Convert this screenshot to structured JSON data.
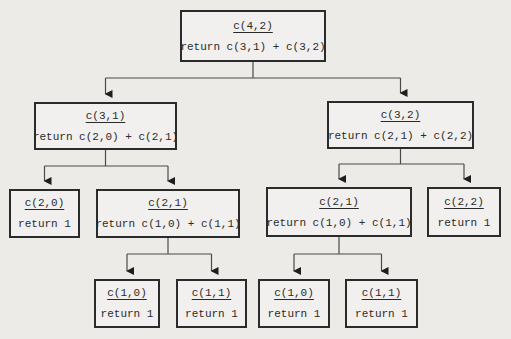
{
  "diagram": {
    "type": "recursion-tree",
    "nodes": [
      {
        "id": "n42",
        "title": "c(4,2)",
        "body": "return c(3,1) + c(3,2)",
        "children": [
          "n31",
          "n32"
        ]
      },
      {
        "id": "n31",
        "title": "c(3,1)",
        "body": "return c(2,0) + c(2,1)",
        "children": [
          "n20",
          "n21a"
        ]
      },
      {
        "id": "n32",
        "title": "c(3,2)",
        "body": "return c(2,1) + c(2,2)",
        "children": [
          "n21b",
          "n22"
        ]
      },
      {
        "id": "n20",
        "title": "c(2,0)",
        "body": "return 1",
        "children": []
      },
      {
        "id": "n21a",
        "title": "c(2,1)",
        "body": "return c(1,0) + c(1,1)",
        "children": [
          "n10a",
          "n11a"
        ]
      },
      {
        "id": "n21b",
        "title": "c(2,1)",
        "body": "return c(1,0) + c(1,1)",
        "children": [
          "n10b",
          "n11b"
        ]
      },
      {
        "id": "n22",
        "title": "c(2,2)",
        "body": "return 1",
        "children": []
      },
      {
        "id": "n10a",
        "title": "c(1,0)",
        "body": "return 1",
        "children": []
      },
      {
        "id": "n11a",
        "title": "c(1,1)",
        "body": "return 1",
        "children": []
      },
      {
        "id": "n10b",
        "title": "c(1,0)",
        "body": "return 1",
        "children": []
      },
      {
        "id": "n11b",
        "title": "c(1,1)",
        "body": "return 1",
        "children": []
      }
    ]
  }
}
